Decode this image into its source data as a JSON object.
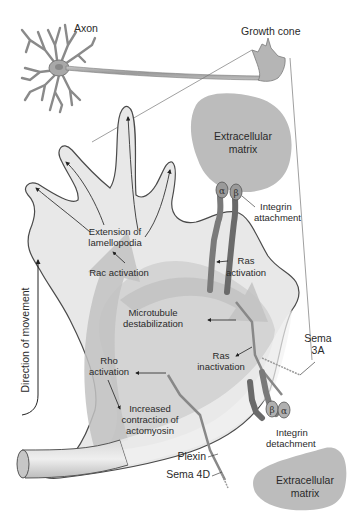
{
  "neuron": {
    "axon_label": "Axon",
    "growth_cone_label": "Growth cone"
  },
  "ecm_top": {
    "label_line1": "Extracellular",
    "label_line2": "matrix"
  },
  "ecm_bottom": {
    "label_line1": "Extracellular",
    "label_line2": "matrix"
  },
  "integrin_top": {
    "alpha": "α",
    "beta": "β",
    "label_line1": "Integrin",
    "label_line2": "attachment"
  },
  "integrin_bottom": {
    "alpha": "α",
    "beta": "β",
    "label_line1": "Integrin",
    "label_line2": "detachment"
  },
  "labels": {
    "extension_line1": "Extension of",
    "extension_line2": "lamellopodia",
    "rac_activation": "Rac activation",
    "ras_activation_line1": "Ras",
    "ras_activation_line2": "activation",
    "microtubule_line1": "Microtubule",
    "microtubule_line2": "destabilization",
    "ras_inactivation_line1": "Ras",
    "ras_inactivation_line2": "inactivation",
    "rho_activation_line1": "Rho",
    "rho_activation_line2": "activation",
    "contraction_line1": "Increased",
    "contraction_line2": "contraction of",
    "contraction_line3": "actomyosin",
    "sema3a_line1": "Sema",
    "sema3a_line2": "3A",
    "plexin": "Plexin",
    "sema4d": "Sema 4D",
    "direction": "Direction of movement"
  },
  "colors": {
    "cone_fill": "#e6e6e6",
    "cone_inner": "#d0d0d0",
    "arrow_fill": "#bdbdbd",
    "ecm_fill": "#bcbcbc",
    "integrin_dark": "#6e6e6e",
    "outline": "#555555"
  }
}
